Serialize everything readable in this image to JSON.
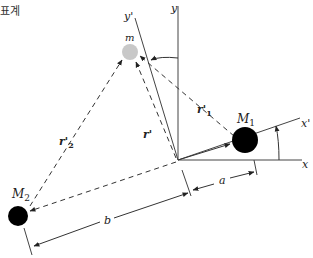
{
  "caption": "표계",
  "labels": {
    "y_axis": "y",
    "y_prime_axis": "y'",
    "x_axis": "x",
    "x_prime_axis": "x'",
    "mass_m": "m",
    "mass_M1": "M",
    "mass_M1_sub": "1",
    "mass_M2": "M",
    "mass_M2_sub": "2",
    "r_prime": "r'",
    "r1_prime": "r'",
    "r1_prime_sub": "1",
    "r2_prime": "r'",
    "r2_prime_sub": "2",
    "dist_a": "a",
    "dist_b": "b"
  },
  "colors": {
    "ink": "#222222",
    "mass_dark": "#000000",
    "mass_light": "#c8c8c8"
  }
}
